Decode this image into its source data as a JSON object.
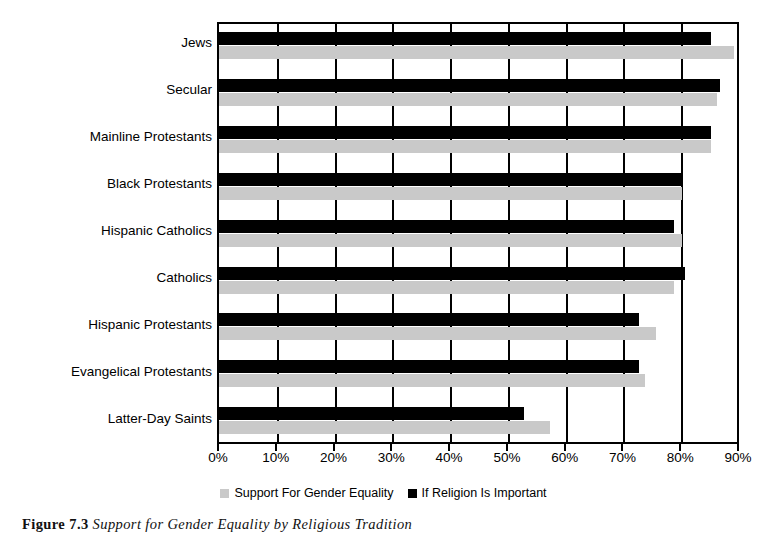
{
  "chart_data": {
    "type": "bar",
    "orientation": "horizontal",
    "title": "",
    "xlabel": "",
    "ylabel": "",
    "xlim": [
      0,
      90
    ],
    "xtick_labels": [
      "0%",
      "10%",
      "20%",
      "30%",
      "40%",
      "50%",
      "60%",
      "70%",
      "80%",
      "90%"
    ],
    "xtick_values": [
      0,
      10,
      20,
      30,
      40,
      50,
      60,
      70,
      80,
      90
    ],
    "grid": true,
    "legend_position": "bottom-center",
    "categories": [
      "Jews",
      "Secular",
      "Mainline Protestants",
      "Black Protestants",
      "Hispanic Catholics",
      "Catholics",
      "Hispanic Protestants",
      "Evangelical Protestants",
      "Latter-Day Saints"
    ],
    "series": [
      {
        "name": "If Religion Is Important",
        "color": "#000000",
        "values": [
          85.5,
          87.0,
          85.5,
          80.5,
          79.0,
          81.0,
          73.0,
          73.0,
          53.0
        ]
      },
      {
        "name": "Support For Gender Equality",
        "color": "#c9c9c9",
        "values": [
          89.5,
          86.5,
          85.5,
          80.5,
          80.5,
          79.0,
          76.0,
          74.0,
          57.5
        ]
      }
    ]
  },
  "legend": {
    "items": [
      {
        "label": "Support For Gender Equality",
        "color": "#c9c9c9"
      },
      {
        "label": "If Religion Is Important",
        "color": "#000000"
      }
    ]
  },
  "caption": {
    "number": "Figure 7.3",
    "text": "Support for Gender Equality by Religious Tradition"
  }
}
